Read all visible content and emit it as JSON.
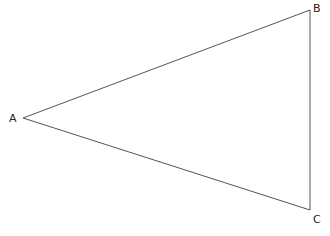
{
  "diagram": {
    "type": "triangle",
    "stroke_color": "#555555",
    "vertices": [
      {
        "label": "A",
        "x": 23,
        "y": 118
      },
      {
        "label": "B",
        "x": 310,
        "y": 10
      },
      {
        "label": "C",
        "x": 310,
        "y": 210
      }
    ],
    "labels": {
      "a": "A",
      "b": "B",
      "c": "C"
    }
  }
}
